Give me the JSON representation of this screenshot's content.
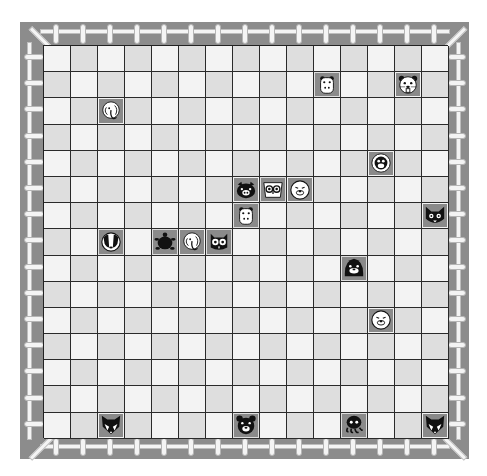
{
  "game": {
    "title": "Animal Matching Board",
    "rows": 15,
    "cols": 15,
    "colors": {
      "frame": "#8c8c8c",
      "fence": "#f4f4f4",
      "cell_light": "#f3f3f3",
      "cell_dark": "#dedede",
      "tile": "#8a8a8a",
      "grid_line": "#2a2a2a"
    }
  },
  "pieces": [
    {
      "animal": "hippo",
      "row": 1,
      "col": 10
    },
    {
      "animal": "beaver",
      "row": 1,
      "col": 13
    },
    {
      "animal": "elephant",
      "row": 2,
      "col": 2
    },
    {
      "animal": "monkey",
      "row": 4,
      "col": 12
    },
    {
      "animal": "pig",
      "row": 5,
      "col": 7
    },
    {
      "animal": "owl",
      "row": 5,
      "col": 8
    },
    {
      "animal": "seal",
      "row": 5,
      "col": 9
    },
    {
      "animal": "hippo",
      "row": 6,
      "col": 7
    },
    {
      "animal": "cat",
      "row": 6,
      "col": 14
    },
    {
      "animal": "badger",
      "row": 7,
      "col": 2
    },
    {
      "animal": "turtle",
      "row": 7,
      "col": 4
    },
    {
      "animal": "elephant",
      "row": 7,
      "col": 5
    },
    {
      "animal": "owl-dark",
      "row": 7,
      "col": 6
    },
    {
      "animal": "seal-dark",
      "row": 8,
      "col": 11
    },
    {
      "animal": "seal",
      "row": 10,
      "col": 12
    },
    {
      "animal": "fox",
      "row": 14,
      "col": 2
    },
    {
      "animal": "bear",
      "row": 14,
      "col": 7
    },
    {
      "animal": "octopus",
      "row": 14,
      "col": 11
    },
    {
      "animal": "fox",
      "row": 14,
      "col": 14
    }
  ]
}
